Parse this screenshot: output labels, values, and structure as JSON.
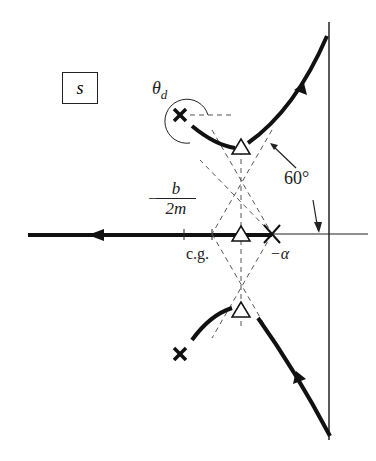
{
  "diagram": {
    "type": "root-locus",
    "plane_label": "s",
    "labels": {
      "theta_d": "θ",
      "theta_d_sub": "d",
      "angle": "60°",
      "b_over_2m_num": "b",
      "b_over_2m_den": "2m",
      "minus_sign": "−",
      "cg": "c.g.",
      "alpha": "−α"
    },
    "poles": [
      "complex pair (upper)",
      "complex pair (lower)",
      "real pole at −α"
    ],
    "zeros_triangles": 3,
    "colors": {
      "ink": "#1a1a1a",
      "dashed": "#555555"
    }
  }
}
